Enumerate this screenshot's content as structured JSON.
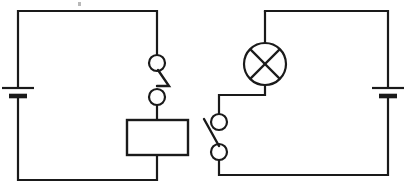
{
  "document": {
    "title": "Two-circuit schematic diagram",
    "background_color": "#ffffff",
    "ink_color": "#1a1a1a",
    "width": 405,
    "height": 188
  },
  "diagram": {
    "type": "electrical-circuit-schematic",
    "circuits": [
      {
        "id": "left-circuit",
        "name": "Left circuit",
        "loop": {
          "left": 18,
          "top": 11,
          "right": 157,
          "bottom": 180
        },
        "components": [
          {
            "type": "battery",
            "name": "left-battery",
            "orientation": "vertical",
            "position": {
              "x": 18,
              "y": 92
            },
            "long_plate_y": 88,
            "short_plate_y": 96,
            "long_plate_half_width": 16,
            "short_plate_half_width": 9
          },
          {
            "type": "switch",
            "name": "left-switch",
            "state": "closed",
            "orientation": "vertical",
            "upper_terminal": {
              "x": 157,
              "y": 63,
              "r": 8
            },
            "lower_terminal": {
              "x": 157,
              "y": 97,
              "r": 8
            },
            "lever_path": "M157,70 L168,86 L157,86"
          },
          {
            "type": "resistor",
            "name": "left-resistor",
            "shape": "rectangle",
            "box": {
              "x": 127,
              "y": 120,
              "width": 61,
              "height": 35
            }
          }
        ]
      },
      {
        "id": "right-circuit",
        "name": "Right circuit",
        "loop": {
          "left": 219,
          "top": 11,
          "right": 388,
          "bottom": 175
        },
        "components": [
          {
            "type": "battery",
            "name": "right-battery",
            "orientation": "vertical",
            "position": {
              "x": 388,
              "y": 92
            },
            "long_plate_y": 88,
            "short_plate_y": 96,
            "long_plate_half_width": 16,
            "short_plate_half_width": 9
          },
          {
            "type": "lamp",
            "name": "lamp",
            "symbol": "circle-with-cross",
            "center": {
              "x": 265,
              "y": 64
            },
            "radius": 21
          },
          {
            "type": "switch",
            "name": "right-switch",
            "state": "open",
            "orientation": "vertical",
            "upper_terminal": {
              "x": 219,
              "y": 122,
              "r": 8
            },
            "lower_terminal": {
              "x": 219,
              "y": 152,
              "r": 8
            },
            "lever_path": "M219,145 L205,120"
          }
        ]
      }
    ],
    "wires": {
      "left_circuit_path": "M18,92 L18,11 L157,11 L157,55 M157,105 L157,120 M157,155 L157,180 L18,180 L18,92",
      "right_circuit_lamp_branch": "M265,11 L265,43 M265,85 L265,95 L219,95 L219,114",
      "right_circuit_outer": "M265,11 L388,11 L388,84 M388,100 L388,175 L219,175 L219,160"
    },
    "scan_artifacts": [
      {
        "name": "paper-speck-top",
        "x": 78,
        "y": 2,
        "width": 3,
        "height": 4
      }
    ]
  }
}
